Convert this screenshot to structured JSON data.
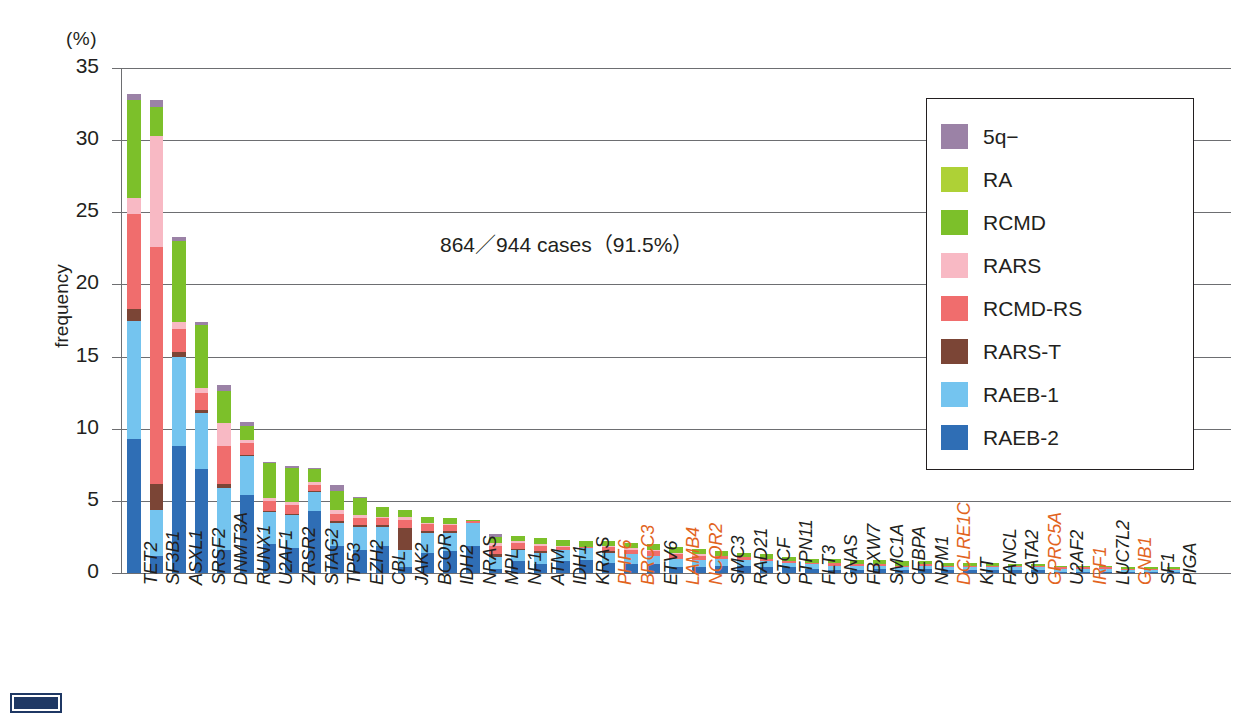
{
  "chart_data": {
    "type": "bar",
    "stacked": true,
    "title": "",
    "xlabel": "",
    "ylabel": "frequency",
    "unit_label": "(%)",
    "ylim": [
      0,
      35
    ],
    "yticks": [
      0,
      5,
      10,
      15,
      20,
      25,
      30,
      35
    ],
    "grid": true,
    "legend_position": "upper-right",
    "annotation": "864／944 cases（91.5%）",
    "series": [
      {
        "name": "5q−",
        "color": "#9b82a6"
      },
      {
        "name": "RA",
        "color": "#aed136"
      },
      {
        "name": "RCMD",
        "color": "#7cc02a"
      },
      {
        "name": "RARS",
        "color": "#f8b9c4"
      },
      {
        "name": "RCMD-RS",
        "color": "#f06d6d"
      },
      {
        "name": "RARS-T",
        "color": "#7b4536"
      },
      {
        "name": "RAEB-1",
        "color": "#74c4ef"
      },
      {
        "name": "RAEB-2",
        "color": "#2f6eb5"
      }
    ],
    "categories": [
      "TET2",
      "SF3B1",
      "ASXL1",
      "SRSF2",
      "DNMT3A",
      "RUNX1",
      "U2AF1",
      "ZRSR2",
      "STAG2",
      "TP53",
      "EZH2",
      "CBL",
      "JAK2",
      "BCOR",
      "IDH2",
      "NRAS",
      "MPL",
      "NF1",
      "ATM",
      "IDH1",
      "KRAS",
      "PHF6",
      "BRCC3",
      "ETV6",
      "LAMB4",
      "NCOR2",
      "SMC3",
      "RAD21",
      "CTCF",
      "PTPN11",
      "FLT3",
      "GNAS",
      "FBXW7",
      "SMC1A",
      "CEBPA",
      "NPM1",
      "DCLRE1C",
      "KIT",
      "FANCL",
      "GATA2",
      "GPRC5A",
      "U2AF2",
      "IRF1",
      "LUC7L2",
      "GNB1",
      "SF1",
      "PIGA"
    ],
    "highlighted_categories": [
      "PHF6",
      "BRCC3",
      "LAMB4",
      "NCOR2",
      "DCLRE1C",
      "GPRC5A",
      "IRF1",
      "GNB1"
    ],
    "highlight_color": "#e2641e",
    "totals": [
      33.2,
      32.8,
      23.3,
      17.4,
      13.0,
      10.5,
      7.7,
      7.4,
      7.3,
      6.1,
      5.3,
      4.6,
      4.4,
      3.9,
      3.8,
      3.7,
      2.7,
      2.6,
      2.4,
      2.3,
      2.2,
      2.2,
      2.1,
      2.0,
      1.8,
      1.7,
      1.5,
      1.4,
      1.3,
      1.1,
      1.0,
      1.0,
      0.9,
      0.9,
      0.8,
      0.8,
      0.7,
      0.7,
      0.7,
      0.6,
      0.6,
      0.5,
      0.5,
      0.5,
      0.4,
      0.4,
      0.4
    ],
    "stacks": [
      {
        "category": "TET2",
        "RAEB-2": 9.3,
        "RAEB-1": 8.2,
        "RARS-T": 0.8,
        "RCMD-RS": 6.6,
        "RARS": 1.1,
        "RCMD": 6.8,
        "RA": 0.0,
        "5q-": 0.4
      },
      {
        "category": "SF3B1",
        "RAEB-2": 1.2,
        "RAEB-1": 3.2,
        "RARS-T": 1.8,
        "RCMD-RS": 16.4,
        "RARS": 7.7,
        "RCMD": 2.0,
        "RA": 0.0,
        "5q-": 0.5
      },
      {
        "category": "ASXL1",
        "RAEB-2": 8.8,
        "RAEB-1": 6.2,
        "RARS-T": 0.3,
        "RCMD-RS": 1.6,
        "RARS": 0.5,
        "RCMD": 5.6,
        "RA": 0.0,
        "5q-": 0.3
      },
      {
        "category": "SRSF2",
        "RAEB-2": 7.2,
        "RAEB-1": 3.9,
        "RARS-T": 0.2,
        "RCMD-RS": 1.2,
        "RARS": 0.3,
        "RCMD": 4.4,
        "RA": 0.0,
        "5q-": 0.2
      },
      {
        "category": "DNMT3A",
        "RAEB-2": 1.6,
        "RAEB-1": 4.3,
        "RARS-T": 0.3,
        "RCMD-RS": 2.6,
        "RARS": 1.6,
        "RCMD": 2.2,
        "RA": 0.0,
        "5q-": 0.4
      },
      {
        "category": "RUNX1",
        "RAEB-2": 5.4,
        "RAEB-1": 2.7,
        "RARS-T": 0.1,
        "RCMD-RS": 0.8,
        "RARS": 0.2,
        "RCMD": 1.0,
        "RA": 0.0,
        "5q-": 0.3
      },
      {
        "category": "U2AF1",
        "RAEB-2": 2.0,
        "RAEB-1": 2.2,
        "RARS-T": 0.1,
        "RCMD-RS": 0.7,
        "RARS": 0.2,
        "RCMD": 2.4,
        "RA": 0.0,
        "5q-": 0.1
      },
      {
        "category": "ZRSR2",
        "RAEB-2": 1.7,
        "RAEB-1": 2.3,
        "RARS-T": 0.1,
        "RCMD-RS": 0.6,
        "RARS": 0.2,
        "RCMD": 2.4,
        "RA": 0.0,
        "5q-": 0.1
      },
      {
        "category": "STAG2",
        "RAEB-2": 4.3,
        "RAEB-1": 1.3,
        "RARS-T": 0.1,
        "RCMD-RS": 0.4,
        "RARS": 0.2,
        "RCMD": 0.9,
        "RA": 0.0,
        "5q-": 0.1
      },
      {
        "category": "TP53",
        "RAEB-2": 1.9,
        "RAEB-1": 1.6,
        "RARS-T": 0.1,
        "RCMD-RS": 0.5,
        "RARS": 0.3,
        "RCMD": 1.3,
        "RA": 0.0,
        "5q-": 0.4
      },
      {
        "category": "EZH2",
        "RAEB-2": 1.6,
        "RAEB-1": 1.6,
        "RARS-T": 0.1,
        "RCMD-RS": 0.5,
        "RARS": 0.2,
        "RCMD": 1.2,
        "RA": 0.0,
        "5q-": 0.1
      },
      {
        "category": "CBL",
        "RAEB-2": 1.9,
        "RAEB-1": 1.3,
        "RARS-T": 0.1,
        "RCMD-RS": 0.5,
        "RARS": 0.1,
        "RCMD": 0.7,
        "RA": 0.0,
        "5q-": 0.0
      },
      {
        "category": "JAK2",
        "RAEB-2": 0.4,
        "RAEB-1": 1.2,
        "RARS-T": 1.5,
        "RCMD-RS": 0.6,
        "RARS": 0.2,
        "RCMD": 0.5,
        "RA": 0.0,
        "5q-": 0.0
      },
      {
        "category": "BCOR",
        "RAEB-2": 1.4,
        "RAEB-1": 1.4,
        "RARS-T": 0.1,
        "RCMD-RS": 0.5,
        "RARS": 0.1,
        "RCMD": 0.4,
        "RA": 0.0,
        "5q-": 0.0
      },
      {
        "category": "IDH2",
        "RAEB-2": 1.5,
        "RAEB-1": 1.3,
        "RARS-T": 0.1,
        "RCMD-RS": 0.4,
        "RARS": 0.1,
        "RCMD": 0.4,
        "RA": 0.0,
        "5q-": 0.0
      },
      {
        "category": "NRAS",
        "RAEB-2": 1.9,
        "RAEB-1": 1.6,
        "RARS-T": 0.0,
        "RCMD-RS": 0.1,
        "RARS": 0.0,
        "RCMD": 0.1,
        "RA": 0.0,
        "5q-": 0.0
      },
      {
        "category": "MPL",
        "RAEB-2": 0.3,
        "RAEB-1": 0.8,
        "RARS-T": 0.2,
        "RCMD-RS": 0.6,
        "RARS": 0.2,
        "RCMD": 0.4,
        "RA": 0.0,
        "5q-": 0.2
      },
      {
        "category": "NF1",
        "RAEB-2": 0.8,
        "RAEB-1": 0.8,
        "RARS-T": 0.1,
        "RCMD-RS": 0.4,
        "RARS": 0.1,
        "RCMD": 0.4,
        "RA": 0.0,
        "5q-": 0.0
      },
      {
        "category": "ATM",
        "RAEB-2": 0.6,
        "RAEB-1": 0.8,
        "RARS-T": 0.1,
        "RCMD-RS": 0.4,
        "RARS": 0.1,
        "RCMD": 0.4,
        "RA": 0.0,
        "5q-": 0.0
      },
      {
        "category": "IDH1",
        "RAEB-2": 0.8,
        "RAEB-1": 0.8,
        "RARS-T": 0.0,
        "RCMD-RS": 0.2,
        "RARS": 0.1,
        "RCMD": 0.4,
        "RA": 0.0,
        "5q-": 0.0
      },
      {
        "category": "KRAS",
        "RAEB-2": 0.9,
        "RAEB-1": 0.8,
        "RARS-T": 0.0,
        "RCMD-RS": 0.1,
        "RARS": 0.0,
        "RCMD": 0.4,
        "RA": 0.0,
        "5q-": 0.0
      },
      {
        "category": "PHF6",
        "RAEB-2": 0.7,
        "RAEB-1": 0.7,
        "RARS-T": 0.1,
        "RCMD-RS": 0.3,
        "RARS": 0.1,
        "RCMD": 0.3,
        "RA": 0.0,
        "5q-": 0.0
      },
      {
        "category": "BRCC3",
        "RAEB-2": 0.6,
        "RAEB-1": 0.7,
        "RARS-T": 0.0,
        "RCMD-RS": 0.3,
        "RARS": 0.1,
        "RCMD": 0.4,
        "RA": 0.0,
        "5q-": 0.0
      },
      {
        "category": "ETV6",
        "RAEB-2": 0.6,
        "RAEB-1": 0.6,
        "RARS-T": 0.0,
        "RCMD-RS": 0.3,
        "RARS": 0.1,
        "RCMD": 0.4,
        "RA": 0.0,
        "5q-": 0.0
      },
      {
        "category": "LAMB4",
        "RAEB-2": 0.4,
        "RAEB-1": 0.6,
        "RARS-T": 0.0,
        "RCMD-RS": 0.3,
        "RARS": 0.1,
        "RCMD": 0.4,
        "RA": 0.0,
        "5q-": 0.0
      },
      {
        "category": "NCOR2",
        "RAEB-2": 0.4,
        "RAEB-1": 0.5,
        "RARS-T": 0.0,
        "RCMD-RS": 0.3,
        "RARS": 0.1,
        "RCMD": 0.4,
        "RA": 0.0,
        "5q-": 0.0
      },
      {
        "category": "SMC3",
        "RAEB-2": 0.5,
        "RAEB-1": 0.5,
        "RARS-T": 0.0,
        "RCMD-RS": 0.2,
        "RARS": 0.0,
        "RCMD": 0.3,
        "RA": 0.0,
        "5q-": 0.0
      },
      {
        "category": "RAD21",
        "RAEB-2": 0.5,
        "RAEB-1": 0.4,
        "RARS-T": 0.0,
        "RCMD-RS": 0.2,
        "RARS": 0.0,
        "RCMD": 0.3,
        "RA": 0.0,
        "5q-": 0.0
      },
      {
        "category": "CTCF",
        "RAEB-2": 0.4,
        "RAEB-1": 0.4,
        "RARS-T": 0.0,
        "RCMD-RS": 0.2,
        "RARS": 0.0,
        "RCMD": 0.3,
        "RA": 0.0,
        "5q-": 0.0
      },
      {
        "category": "PTPN11",
        "RAEB-2": 0.4,
        "RAEB-1": 0.3,
        "RARS-T": 0.0,
        "RCMD-RS": 0.1,
        "RARS": 0.0,
        "RCMD": 0.3,
        "RA": 0.0,
        "5q-": 0.0
      },
      {
        "category": "FLT3",
        "RAEB-2": 0.3,
        "RAEB-1": 0.3,
        "RARS-T": 0.0,
        "RCMD-RS": 0.1,
        "RARS": 0.0,
        "RCMD": 0.3,
        "RA": 0.0,
        "5q-": 0.0
      },
      {
        "category": "GNAS",
        "RAEB-2": 0.2,
        "RAEB-1": 0.3,
        "RARS-T": 0.0,
        "RCMD-RS": 0.2,
        "RARS": 0.0,
        "RCMD": 0.3,
        "RA": 0.0,
        "5q-": 0.0
      },
      {
        "category": "FBXW7",
        "RAEB-2": 0.2,
        "RAEB-1": 0.3,
        "RARS-T": 0.0,
        "RCMD-RS": 0.1,
        "RARS": 0.0,
        "RCMD": 0.3,
        "RA": 0.0,
        "5q-": 0.0
      },
      {
        "category": "SMC1A",
        "RAEB-2": 0.3,
        "RAEB-1": 0.2,
        "RARS-T": 0.0,
        "RCMD-RS": 0.1,
        "RARS": 0.0,
        "RCMD": 0.3,
        "RA": 0.0,
        "5q-": 0.0
      },
      {
        "category": "CEBPA",
        "RAEB-2": 0.2,
        "RAEB-1": 0.2,
        "RARS-T": 0.0,
        "RCMD-RS": 0.1,
        "RARS": 0.0,
        "RCMD": 0.3,
        "RA": 0.0,
        "5q-": 0.0
      },
      {
        "category": "NPM1",
        "RAEB-2": 0.3,
        "RAEB-1": 0.2,
        "RARS-T": 0.0,
        "RCMD-RS": 0.1,
        "RARS": 0.0,
        "RCMD": 0.2,
        "RA": 0.0,
        "5q-": 0.0
      },
      {
        "category": "DCLRE1C",
        "RAEB-2": 0.2,
        "RAEB-1": 0.2,
        "RARS-T": 0.0,
        "RCMD-RS": 0.1,
        "RARS": 0.0,
        "RCMD": 0.2,
        "RA": 0.0,
        "5q-": 0.0
      },
      {
        "category": "KIT",
        "RAEB-2": 0.2,
        "RAEB-1": 0.2,
        "RARS-T": 0.0,
        "RCMD-RS": 0.1,
        "RARS": 0.0,
        "RCMD": 0.2,
        "RA": 0.0,
        "5q-": 0.0
      },
      {
        "category": "FANCL",
        "RAEB-2": 0.2,
        "RAEB-1": 0.2,
        "RARS-T": 0.0,
        "RCMD-RS": 0.1,
        "RARS": 0.0,
        "RCMD": 0.2,
        "RA": 0.0,
        "5q-": 0.0
      },
      {
        "category": "GATA2",
        "RAEB-2": 0.2,
        "RAEB-1": 0.2,
        "RARS-T": 0.0,
        "RCMD-RS": 0.1,
        "RARS": 0.0,
        "RCMD": 0.1,
        "RA": 0.0,
        "5q-": 0.0
      },
      {
        "category": "GPRC5A",
        "RAEB-2": 0.2,
        "RAEB-1": 0.2,
        "RARS-T": 0.0,
        "RCMD-RS": 0.1,
        "RARS": 0.0,
        "RCMD": 0.1,
        "RA": 0.0,
        "5q-": 0.0
      },
      {
        "category": "U2AF2",
        "RAEB-2": 0.1,
        "RAEB-1": 0.2,
        "RARS-T": 0.0,
        "RCMD-RS": 0.1,
        "RARS": 0.0,
        "RCMD": 0.1,
        "RA": 0.0,
        "5q-": 0.0
      },
      {
        "category": "IRF1",
        "RAEB-2": 0.1,
        "RAEB-1": 0.2,
        "RARS-T": 0.0,
        "RCMD-RS": 0.1,
        "RARS": 0.0,
        "RCMD": 0.1,
        "RA": 0.0,
        "5q-": 0.0
      },
      {
        "category": "LUC7L2",
        "RAEB-2": 0.1,
        "RAEB-1": 0.2,
        "RARS-T": 0.0,
        "RCMD-RS": 0.1,
        "RARS": 0.0,
        "RCMD": 0.1,
        "RA": 0.0,
        "5q-": 0.0
      },
      {
        "category": "GNB1",
        "RAEB-2": 0.1,
        "RAEB-1": 0.1,
        "RARS-T": 0.0,
        "RCMD-RS": 0.1,
        "RARS": 0.0,
        "RCMD": 0.1,
        "RA": 0.0,
        "5q-": 0.0
      },
      {
        "category": "SF1",
        "RAEB-2": 0.1,
        "RAEB-1": 0.1,
        "RARS-T": 0.0,
        "RCMD-RS": 0.1,
        "RARS": 0.0,
        "RCMD": 0.1,
        "RA": 0.0,
        "5q-": 0.0
      },
      {
        "category": "PIGA",
        "RAEB-2": 0.1,
        "RAEB-1": 0.1,
        "RARS-T": 0.0,
        "RCMD-RS": 0.1,
        "RARS": 0.0,
        "RCMD": 0.1,
        "RA": 0.0,
        "5q-": 0.0
      }
    ]
  }
}
